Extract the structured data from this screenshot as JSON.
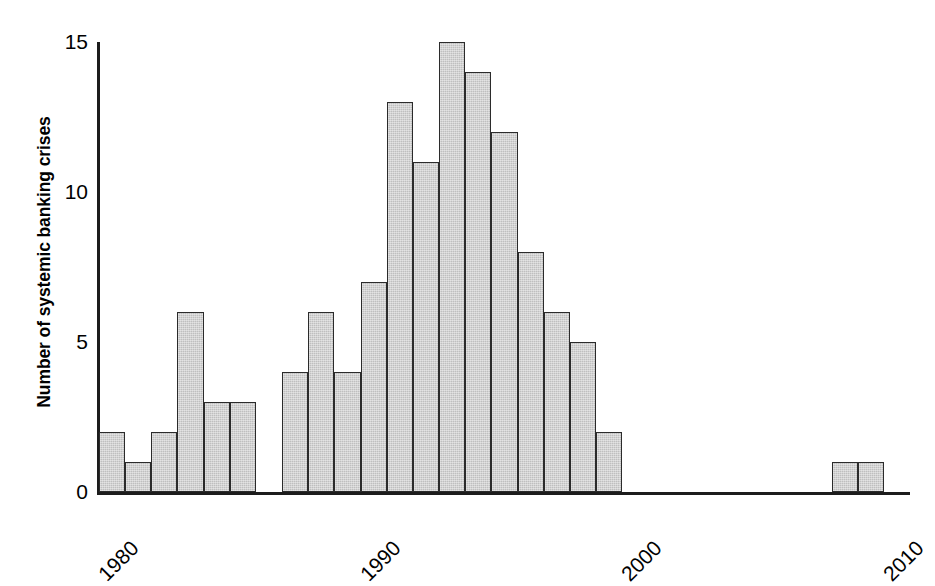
{
  "chart_data": {
    "type": "bar",
    "title": "",
    "subtitle": "",
    "xlabel": "",
    "ylabel": "Number of systemic banking crises",
    "xlim": [
      1980,
      2011
    ],
    "ylim": [
      0,
      15
    ],
    "yticks": [
      0,
      5,
      10,
      15
    ],
    "ytick_labels": [
      "0",
      "5",
      "10",
      "15"
    ],
    "xticks": [
      1980,
      1990,
      2000,
      2010
    ],
    "xtick_labels": [
      "1980",
      "1990",
      "2000",
      "2010"
    ],
    "grid": false,
    "legend": null,
    "bar_fill_color": "#bfbfbf",
    "bar_edge_color": "#2b2b2b",
    "axis_color": "#1c1c1c",
    "background_color": "#ffffff",
    "categories": [
      1980,
      1981,
      1982,
      1983,
      1984,
      1985,
      1986,
      1987,
      1988,
      1989,
      1990,
      1991,
      1992,
      1993,
      1994,
      1995,
      1996,
      1997,
      1998,
      1999,
      2000,
      2001,
      2002,
      2003,
      2004,
      2005,
      2006,
      2007,
      2008,
      2009,
      2010
    ],
    "values": [
      2,
      1,
      2,
      6,
      3,
      3,
      0,
      4,
      6,
      4,
      7,
      13,
      11,
      15,
      14,
      12,
      8,
      6,
      5,
      2,
      0,
      0,
      0,
      0,
      0,
      0,
      0,
      0,
      1,
      1,
      0
    ]
  }
}
